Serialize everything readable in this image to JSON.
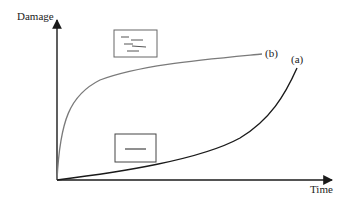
{
  "diagram": {
    "type": "damage-vs-time",
    "y_axis_label": "Damage",
    "x_axis_label": "Time",
    "curves": [
      {
        "id": "b",
        "label": "(b)",
        "description": "rapid initial damage then saturating",
        "color": "#7a7a7a"
      },
      {
        "id": "a",
        "label": "(a)",
        "description": "slow initial damage then accelerating",
        "color": "#1a1a1a"
      }
    ],
    "insets": [
      {
        "id": "many-microcracks",
        "position": "top",
        "crack_count": 5
      },
      {
        "id": "single-crack",
        "position": "bottom",
        "crack_count": 1
      }
    ],
    "colors": {
      "axis": "#1a1a1a",
      "curve_a": "#1a1a1a",
      "curve_b": "#7a7a7a",
      "inset_border": "#555555"
    }
  }
}
